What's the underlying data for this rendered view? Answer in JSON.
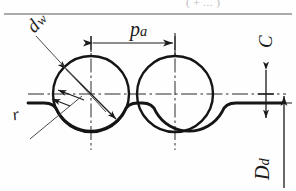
{
  "figure": {
    "type": "engineering-drawing",
    "background_color": "#fefefe",
    "line_color": "#1a1a1a",
    "top_rule": {
      "present": true,
      "cut_off_text": "( + ... )"
    },
    "labels": {
      "ball_diameter": {
        "symbol": "d",
        "subscript": "w",
        "text": "dw"
      },
      "pitch": {
        "symbol": "p",
        "subscript": "a",
        "text": "pa"
      },
      "fillet_radius": {
        "symbol": "r",
        "subscript": "",
        "text": "r"
      },
      "clearance": {
        "symbol": "C",
        "subscript": "",
        "text": "C"
      },
      "root_diameter": {
        "symbol": "D",
        "subscript": "d",
        "text": "Dd"
      }
    },
    "geometry": {
      "circle_left_center": [
        91,
        94
      ],
      "circle_right_center": [
        175,
        94
      ],
      "circle_radius": 38,
      "pitch_px": 84,
      "centerline_y": 94,
      "groove_land_y": 103,
      "dimension_line_y": 43
    }
  }
}
